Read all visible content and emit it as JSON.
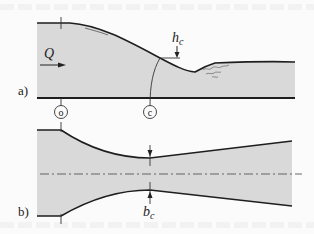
{
  "figure": {
    "panels": [
      {
        "id": "a",
        "label": "a)",
        "view": "longitudinal section",
        "flow_label": "Q",
        "critical_depth_label": "h",
        "critical_depth_sub": "c",
        "section_markers": [
          "o",
          "c"
        ]
      },
      {
        "id": "b",
        "label": "b)",
        "view": "plan view",
        "critical_width_label": "b",
        "critical_width_sub": "c"
      }
    ],
    "colors": {
      "water_fill": "#d9d9d9",
      "line": "#1e1e1e",
      "background": "#fbfbfb"
    }
  }
}
